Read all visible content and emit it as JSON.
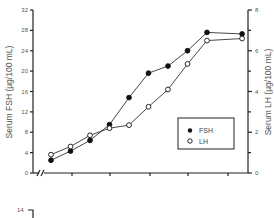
{
  "chart_data": {
    "type": "line",
    "title": "",
    "xlabel": "",
    "x": [
      1,
      2,
      3,
      4,
      5,
      6,
      7,
      8,
      9,
      10.8
    ],
    "series": [
      {
        "name": "FSH",
        "axis": "left",
        "marker": "filled-circle",
        "values": [
          2.5,
          4.3,
          6.4,
          9.5,
          14.8,
          19.6,
          21.0,
          24.0,
          27.6,
          27.3
        ]
      },
      {
        "name": "LH",
        "axis": "right",
        "marker": "open-circle",
        "values": [
          0.9,
          1.3,
          1.85,
          2.2,
          2.35,
          3.25,
          4.1,
          5.35,
          6.5,
          6.6
        ]
      }
    ],
    "y_left": {
      "label": "Serum FSH (µg/100 mL)",
      "ylim": [
        0,
        32
      ],
      "ticks": [
        "0",
        "4",
        "8",
        "12",
        "16",
        "20",
        "24",
        "28",
        "32"
      ]
    },
    "y_right": {
      "label": "Serum LH (µg/100 mL)",
      "ylim": [
        0,
        8
      ],
      "ticks": [
        "0",
        "2",
        "4",
        "6",
        "8"
      ],
      "minor_ticks": [
        1,
        3,
        5,
        7
      ]
    },
    "x_axis": {
      "broken": true,
      "tick_labels": []
    },
    "legend": {
      "position": "bottom-right",
      "entries": [
        {
          "label": "FSH",
          "marker": "filled-circle"
        },
        {
          "label": "LH",
          "marker": "open-circle"
        }
      ]
    },
    "grid": false,
    "second_panel": {
      "partial": true,
      "visible_tick": "14"
    }
  }
}
